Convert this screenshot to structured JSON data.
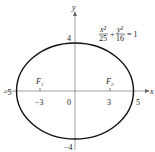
{
  "figure": {
    "equation": {
      "x_num": "x²",
      "x_den": "25",
      "plus": "+",
      "y_num": "y²",
      "y_den": "16",
      "rhs": "= 1"
    },
    "axes": {
      "x_label": "x",
      "y_label": "y",
      "x_ticks": [
        "−5",
        "−3",
        "0",
        "3",
        "5"
      ],
      "y_ticks": [
        "4",
        "−4"
      ]
    },
    "foci": [
      {
        "label": "F",
        "sub": "1",
        "x": -3
      },
      {
        "label": "F",
        "sub": "2",
        "x": 3
      }
    ],
    "ellipse": {
      "a": 5,
      "b": 4
    },
    "colors": {
      "curve": "#111111",
      "axis": "#888888",
      "text": "#222222"
    }
  }
}
